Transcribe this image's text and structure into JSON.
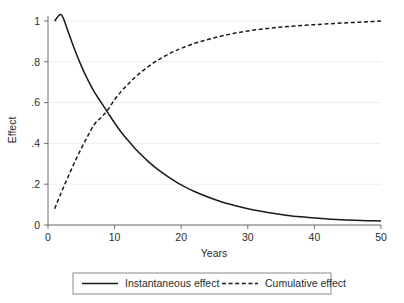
{
  "chart_data": {
    "type": "line",
    "title": "",
    "xlabel": "Years",
    "ylabel": "Effect",
    "xlim": [
      0,
      50
    ],
    "ylim": [
      0,
      1.05
    ],
    "xticks": [
      0,
      10,
      20,
      30,
      40,
      50
    ],
    "xticklabels": [
      "0",
      "10",
      "20",
      "30",
      "40",
      "50"
    ],
    "yticks": [
      0,
      0.2,
      0.4,
      0.6,
      0.8,
      1
    ],
    "yticklabels": [
      "0",
      ".2",
      ".4",
      ".6",
      ".8",
      "1"
    ],
    "grid": "horizontal",
    "legend_position": "below",
    "background_color": "#ffffff",
    "line_color": "#1a1a1a",
    "grid_color": "#ededed",
    "axis_color": "#6e6e6e",
    "series": [
      {
        "name": "Instantaneous effect",
        "style": "solid",
        "x": [
          1,
          2,
          3,
          4,
          5,
          6,
          7,
          8,
          9,
          10,
          11,
          12,
          13,
          14,
          15,
          16,
          17,
          18,
          19,
          20,
          22,
          24,
          26,
          28,
          30,
          32,
          34,
          36,
          38,
          40,
          42,
          44,
          46,
          48,
          50
        ],
        "values": [
          1.0,
          1.03,
          0.95,
          0.86,
          0.78,
          0.71,
          0.65,
          0.6,
          0.55,
          0.5,
          0.455,
          0.415,
          0.378,
          0.344,
          0.313,
          0.285,
          0.26,
          0.237,
          0.216,
          0.197,
          0.164,
          0.137,
          0.114,
          0.096,
          0.08,
          0.067,
          0.056,
          0.047,
          0.04,
          0.034,
          0.029,
          0.026,
          0.023,
          0.021,
          0.02
        ]
      },
      {
        "name": "Cumulative effect",
        "style": "dashed",
        "x": [
          1,
          2,
          3,
          4,
          5,
          6,
          7,
          8,
          9,
          10,
          11,
          12,
          13,
          14,
          15,
          16,
          17,
          18,
          19,
          20,
          22,
          24,
          26,
          28,
          30,
          32,
          34,
          36,
          38,
          40,
          42,
          44,
          46,
          48,
          50
        ],
        "values": [
          0.08,
          0.16,
          0.235,
          0.308,
          0.375,
          0.438,
          0.495,
          0.528,
          0.565,
          0.615,
          0.655,
          0.69,
          0.722,
          0.75,
          0.775,
          0.798,
          0.818,
          0.836,
          0.852,
          0.866,
          0.89,
          0.909,
          0.926,
          0.94,
          0.951,
          0.96,
          0.967,
          0.973,
          0.978,
          0.982,
          0.986,
          0.99,
          0.993,
          0.996,
          1.0
        ]
      }
    ],
    "annotations": {
      "crossover_year": 9,
      "crossover_value": 0.55
    }
  },
  "legend": {
    "entries": [
      {
        "label": "Instantaneous effect",
        "style": "solid"
      },
      {
        "label": "Cumulative effect",
        "style": "dashed"
      }
    ]
  }
}
